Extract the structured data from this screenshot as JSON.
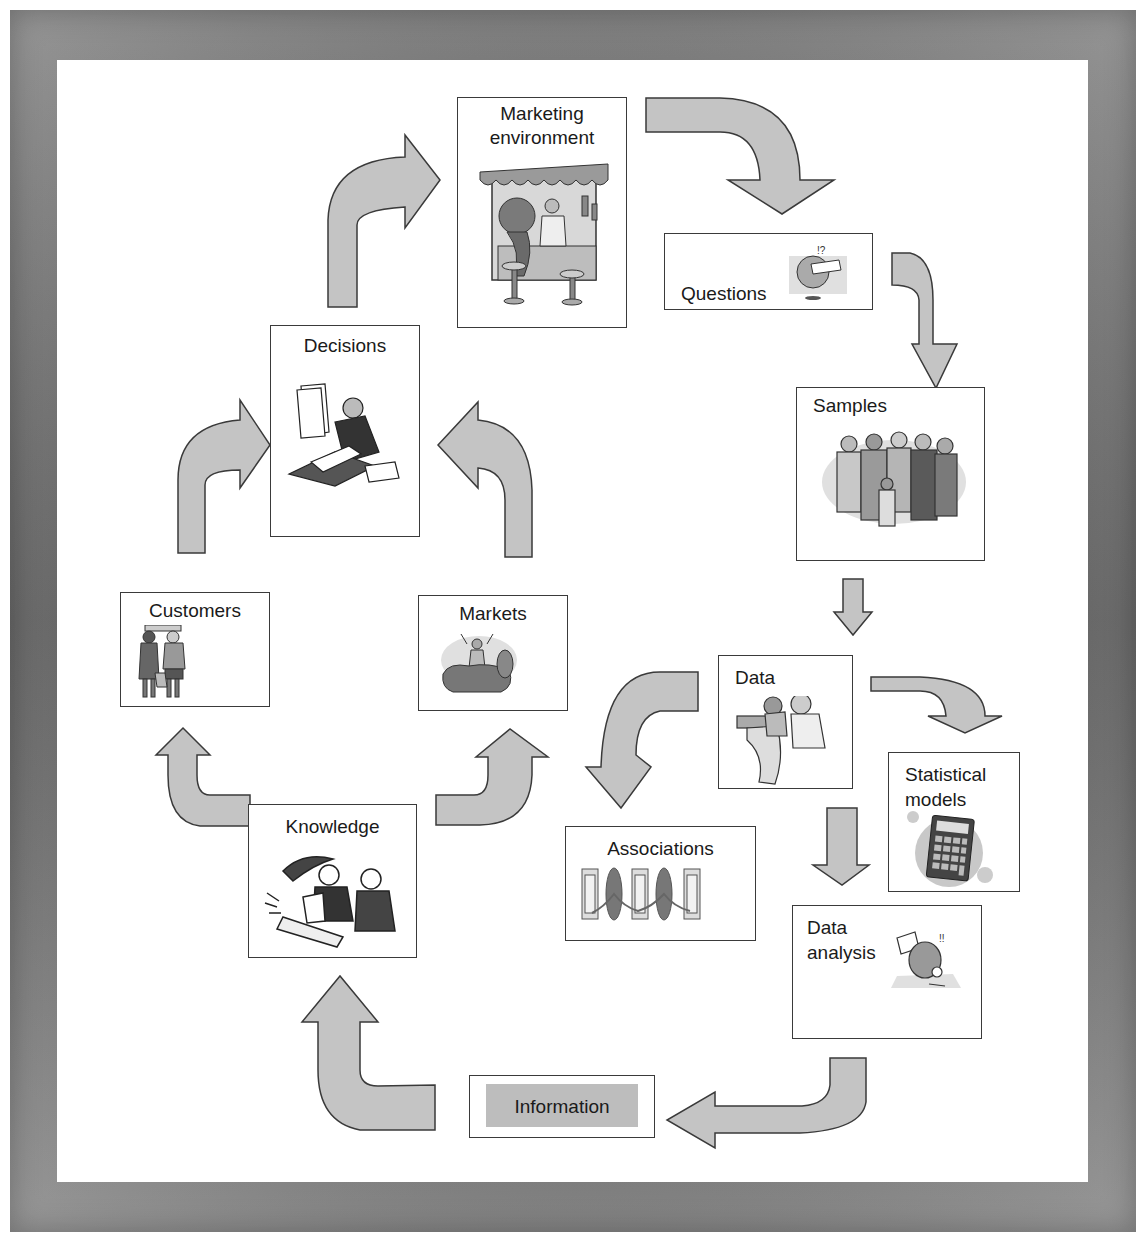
{
  "diagram": {
    "type": "cyclic-flow",
    "nodes": [
      {
        "id": "marketing_environment",
        "label": "Marketing environment",
        "line1": "Marketing",
        "line2": "environment",
        "icon": "market-stall-icon"
      },
      {
        "id": "questions",
        "label": "Questions",
        "icon": "puzzled-person-icon"
      },
      {
        "id": "samples",
        "label": "Samples",
        "icon": "group-of-people-icon"
      },
      {
        "id": "data",
        "label": "Data",
        "icon": "people-reading-printout-icon"
      },
      {
        "id": "statistical_models",
        "label": "Statistical models",
        "line1": "Statistical",
        "line2": "models",
        "icon": "calculator-icon"
      },
      {
        "id": "associations",
        "label": "Associations",
        "icon": "linked-reels-icon"
      },
      {
        "id": "data_analysis",
        "label": "Data analysis",
        "line1": "Data",
        "line2": "analysis",
        "icon": "magnifier-person-icon"
      },
      {
        "id": "information",
        "label": "Information",
        "icon": null
      },
      {
        "id": "knowledge",
        "label": "Knowledge",
        "icon": "business-people-icon"
      },
      {
        "id": "customers",
        "label": "Customers",
        "icon": "shoppers-icon"
      },
      {
        "id": "markets",
        "label": "Markets",
        "icon": "market-crowd-icon"
      },
      {
        "id": "decisions",
        "label": "Decisions",
        "icon": "person-with-papers-icon"
      }
    ],
    "edges": [
      {
        "from": "marketing_environment",
        "to": "questions"
      },
      {
        "from": "questions",
        "to": "samples"
      },
      {
        "from": "samples",
        "to": "data"
      },
      {
        "from": "data",
        "to": "associations"
      },
      {
        "from": "data",
        "to": "statistical_models"
      },
      {
        "from": "data",
        "to": "data_analysis"
      },
      {
        "from": "data_analysis",
        "to": "information"
      },
      {
        "from": "information",
        "to": "knowledge"
      },
      {
        "from": "knowledge",
        "to": "customers"
      },
      {
        "from": "knowledge",
        "to": "markets"
      },
      {
        "from": "customers",
        "to": "decisions"
      },
      {
        "from": "markets",
        "to": "decisions"
      },
      {
        "from": "decisions",
        "to": "marketing_environment"
      }
    ]
  },
  "colors": {
    "arrow_fill": "#c4c4c4",
    "border": "#3a3a3a",
    "frame": "#6a6a6a",
    "information_fill": "#bdbdbd"
  }
}
